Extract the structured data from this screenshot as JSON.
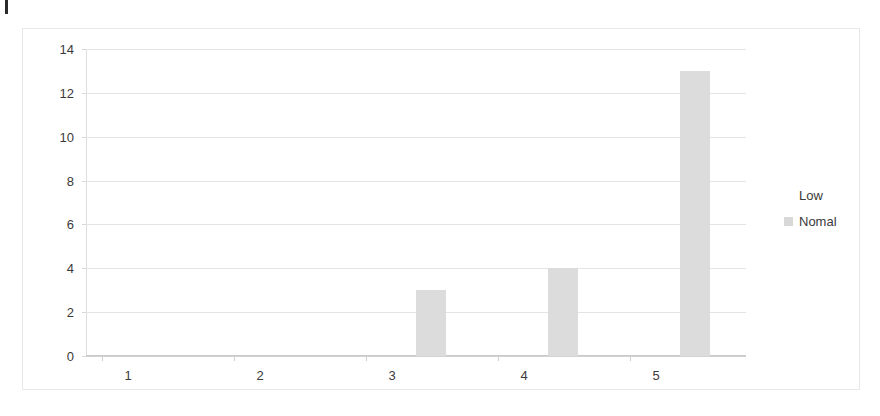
{
  "page": {
    "margin_mark": "",
    "background_color": "#ffffff"
  },
  "chart_data": {
    "type": "bar",
    "title": "",
    "subtitle": "",
    "xlabel": "",
    "ylabel": "",
    "categories": [
      "1",
      "2",
      "3",
      "4",
      "5"
    ],
    "series": [
      {
        "name": "Low",
        "color": "#ffffff",
        "values": [
          0,
          0,
          0,
          0,
          0
        ]
      },
      {
        "name": "Nomal",
        "color": "#dcdcdc",
        "values": [
          0,
          0,
          3,
          4,
          13
        ]
      }
    ],
    "ylim": [
      0,
      14
    ],
    "yticks": [
      "0",
      "2",
      "4",
      "6",
      "8",
      "10",
      "12",
      "14"
    ],
    "ytick_values": [
      0,
      2,
      4,
      6,
      8,
      10,
      12,
      14
    ],
    "xticks": [
      "1",
      "2",
      "3",
      "4",
      "5"
    ],
    "grid": true,
    "grid_axis": "y",
    "legend_position": "right",
    "frame_border_color": "#e8e8e8",
    "gridline_color": "#e4e4e4",
    "axis_color": "#c9c9c9",
    "tick_label_color": "#3a3a3a"
  },
  "legend": {
    "items": [
      {
        "label": "Low",
        "swatch_color": "#ffffff"
      },
      {
        "label": "Nomal",
        "swatch_color": "#d8d8d8"
      }
    ]
  }
}
